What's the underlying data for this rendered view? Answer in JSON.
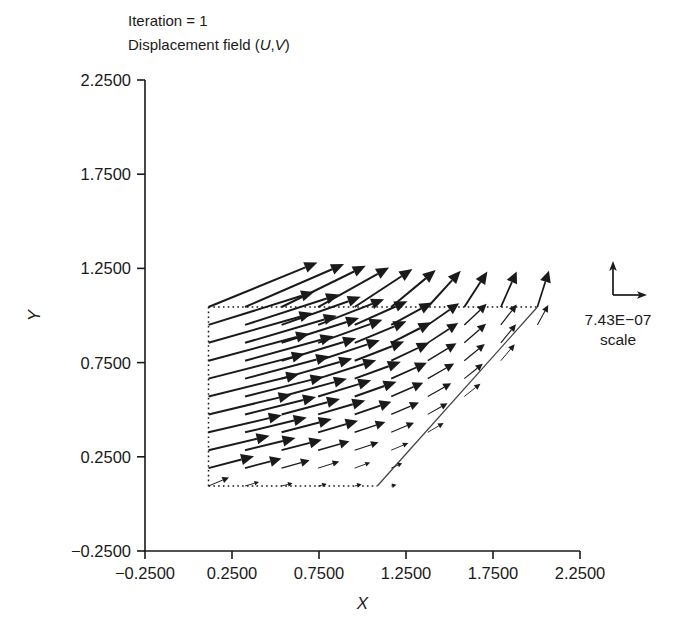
{
  "figure": {
    "annotations": [
      {
        "name": "iteration-label",
        "text": "Iteration = 1"
      },
      {
        "name": "field-label",
        "text": "Displacement field (U,V)"
      }
    ],
    "legend": {
      "magnitude": "7.43E−07",
      "caption": "scale",
      "up_arrow_icon": "arrow-up-icon",
      "right_arrow_icon": "arrow-right-icon"
    }
  },
  "chart_data": {
    "type": "quiver",
    "title": "Iteration = 1",
    "subtitle": "Displacement field (U,V)",
    "xlabel": "X",
    "ylabel": "Y",
    "xlim": [
      -0.25,
      2.25
    ],
    "ylim": [
      -0.25,
      2.25
    ],
    "xticks": [
      -0.25,
      0.25,
      0.75,
      1.25,
      1.75,
      2.25
    ],
    "yticks": [
      -0.25,
      0.25,
      0.75,
      1.25,
      1.75,
      2.25
    ],
    "xticklabels": [
      "−0.2500",
      "0.2500",
      "0.7500",
      "1.2500",
      "1.7500",
      "2.2500"
    ],
    "yticklabels": [
      "−0.2500",
      "0.2500",
      "0.7500",
      "1.2500",
      "1.7500",
      "2.2500"
    ],
    "grid": false,
    "legend_position": "right",
    "scale_reference": 7.43e-07,
    "scale_caption": "scale",
    "domain": {
      "description": "trapezoidal mesh boundary",
      "dotted_edges": [
        [
          [
            0.115,
            0.095
          ],
          [
            0.115,
            1.045
          ]
        ],
        [
          [
            0.115,
            1.045
          ],
          [
            2.005,
            1.045
          ]
        ],
        [
          [
            0.115,
            0.095
          ],
          [
            1.085,
            0.095
          ]
        ]
      ],
      "solid_edges": [
        [
          [
            1.085,
            0.095
          ],
          [
            2.005,
            1.045
          ]
        ]
      ]
    },
    "grid_nx": 10,
    "grid_ny": 11,
    "grid_x": [
      0.115,
      0.325,
      0.535,
      0.745,
      0.955,
      1.165,
      1.375,
      1.585,
      1.795,
      2.005
    ],
    "grid_y": [
      0.095,
      0.19,
      0.285,
      0.38,
      0.475,
      0.57,
      0.665,
      0.76,
      0.855,
      0.95,
      1.045
    ],
    "arrow_scale_px_per_unit": 330,
    "vectors": [
      {
        "x": 0.115,
        "y": 1.045,
        "u": 0.33,
        "v": 0.135
      },
      {
        "x": 0.325,
        "y": 1.045,
        "u": 0.3,
        "v": 0.13
      },
      {
        "x": 0.535,
        "y": 1.045,
        "u": 0.255,
        "v": 0.125
      },
      {
        "x": 0.745,
        "y": 1.045,
        "u": 0.215,
        "v": 0.12
      },
      {
        "x": 0.955,
        "y": 1.045,
        "u": 0.175,
        "v": 0.115
      },
      {
        "x": 1.165,
        "y": 1.045,
        "u": 0.135,
        "v": 0.112
      },
      {
        "x": 1.375,
        "y": 1.045,
        "u": 0.1,
        "v": 0.11
      },
      {
        "x": 1.585,
        "y": 1.045,
        "u": 0.07,
        "v": 0.108
      },
      {
        "x": 1.795,
        "y": 1.045,
        "u": 0.048,
        "v": 0.108
      },
      {
        "x": 2.005,
        "y": 1.045,
        "u": 0.035,
        "v": 0.11
      },
      {
        "x": 0.115,
        "y": 0.95,
        "u": 0.32,
        "v": 0.1
      },
      {
        "x": 0.325,
        "y": 0.95,
        "u": 0.285,
        "v": 0.092
      },
      {
        "x": 0.535,
        "y": 0.95,
        "u": 0.24,
        "v": 0.085
      },
      {
        "x": 0.745,
        "y": 0.95,
        "u": 0.2,
        "v": 0.078
      },
      {
        "x": 0.955,
        "y": 0.95,
        "u": 0.16,
        "v": 0.072
      },
      {
        "x": 1.165,
        "y": 0.95,
        "u": 0.125,
        "v": 0.068
      },
      {
        "x": 1.375,
        "y": 0.95,
        "u": 0.095,
        "v": 0.066
      },
      {
        "x": 1.585,
        "y": 0.95,
        "u": 0.068,
        "v": 0.064
      },
      {
        "x": 1.795,
        "y": 0.95,
        "u": 0.048,
        "v": 0.062
      },
      {
        "x": 2.005,
        "y": 0.95,
        "u": 0.033,
        "v": 0.06
      },
      {
        "x": 0.115,
        "y": 0.855,
        "u": 0.315,
        "v": 0.09
      },
      {
        "x": 0.325,
        "y": 0.855,
        "u": 0.278,
        "v": 0.082
      },
      {
        "x": 0.535,
        "y": 0.855,
        "u": 0.235,
        "v": 0.075
      },
      {
        "x": 0.745,
        "y": 0.855,
        "u": 0.195,
        "v": 0.07
      },
      {
        "x": 0.955,
        "y": 0.855,
        "u": 0.157,
        "v": 0.065
      },
      {
        "x": 1.165,
        "y": 0.855,
        "u": 0.122,
        "v": 0.062
      },
      {
        "x": 1.375,
        "y": 0.855,
        "u": 0.092,
        "v": 0.06
      },
      {
        "x": 1.585,
        "y": 0.855,
        "u": 0.066,
        "v": 0.058
      },
      {
        "x": 1.795,
        "y": 0.855,
        "u": 0.046,
        "v": 0.056
      },
      {
        "x": 0.115,
        "y": 0.76,
        "u": 0.305,
        "v": 0.082
      },
      {
        "x": 0.325,
        "y": 0.76,
        "u": 0.268,
        "v": 0.074
      },
      {
        "x": 0.535,
        "y": 0.76,
        "u": 0.226,
        "v": 0.068
      },
      {
        "x": 0.745,
        "y": 0.76,
        "u": 0.187,
        "v": 0.062
      },
      {
        "x": 0.955,
        "y": 0.76,
        "u": 0.15,
        "v": 0.058
      },
      {
        "x": 1.165,
        "y": 0.76,
        "u": 0.116,
        "v": 0.055
      },
      {
        "x": 1.375,
        "y": 0.76,
        "u": 0.087,
        "v": 0.053
      },
      {
        "x": 1.585,
        "y": 0.76,
        "u": 0.062,
        "v": 0.051
      },
      {
        "x": 1.795,
        "y": 0.76,
        "u": 0.042,
        "v": 0.05
      },
      {
        "x": 0.115,
        "y": 0.665,
        "u": 0.292,
        "v": 0.075
      },
      {
        "x": 0.325,
        "y": 0.665,
        "u": 0.255,
        "v": 0.068
      },
      {
        "x": 0.535,
        "y": 0.665,
        "u": 0.214,
        "v": 0.061
      },
      {
        "x": 0.745,
        "y": 0.665,
        "u": 0.176,
        "v": 0.056
      },
      {
        "x": 0.955,
        "y": 0.665,
        "u": 0.14,
        "v": 0.051
      },
      {
        "x": 1.165,
        "y": 0.665,
        "u": 0.108,
        "v": 0.048
      },
      {
        "x": 1.375,
        "y": 0.665,
        "u": 0.08,
        "v": 0.046
      },
      {
        "x": 1.585,
        "y": 0.665,
        "u": 0.056,
        "v": 0.045
      },
      {
        "x": 0.115,
        "y": 0.57,
        "u": 0.275,
        "v": 0.068
      },
      {
        "x": 0.325,
        "y": 0.57,
        "u": 0.238,
        "v": 0.06
      },
      {
        "x": 0.535,
        "y": 0.57,
        "u": 0.198,
        "v": 0.054
      },
      {
        "x": 0.745,
        "y": 0.57,
        "u": 0.161,
        "v": 0.049
      },
      {
        "x": 0.955,
        "y": 0.57,
        "u": 0.127,
        "v": 0.045
      },
      {
        "x": 1.165,
        "y": 0.57,
        "u": 0.097,
        "v": 0.042
      },
      {
        "x": 1.375,
        "y": 0.57,
        "u": 0.071,
        "v": 0.04
      },
      {
        "x": 1.585,
        "y": 0.57,
        "u": 0.049,
        "v": 0.039
      },
      {
        "x": 0.115,
        "y": 0.475,
        "u": 0.252,
        "v": 0.06
      },
      {
        "x": 0.325,
        "y": 0.475,
        "u": 0.215,
        "v": 0.053
      },
      {
        "x": 0.535,
        "y": 0.475,
        "u": 0.177,
        "v": 0.047
      },
      {
        "x": 0.745,
        "y": 0.475,
        "u": 0.143,
        "v": 0.042
      },
      {
        "x": 0.955,
        "y": 0.475,
        "u": 0.111,
        "v": 0.038
      },
      {
        "x": 1.165,
        "y": 0.475,
        "u": 0.084,
        "v": 0.036
      },
      {
        "x": 1.375,
        "y": 0.475,
        "u": 0.06,
        "v": 0.034
      },
      {
        "x": 0.115,
        "y": 0.38,
        "u": 0.222,
        "v": 0.052
      },
      {
        "x": 0.325,
        "y": 0.38,
        "u": 0.187,
        "v": 0.045
      },
      {
        "x": 0.535,
        "y": 0.38,
        "u": 0.152,
        "v": 0.04
      },
      {
        "x": 0.745,
        "y": 0.38,
        "u": 0.121,
        "v": 0.035
      },
      {
        "x": 0.955,
        "y": 0.38,
        "u": 0.093,
        "v": 0.031
      },
      {
        "x": 1.165,
        "y": 0.38,
        "u": 0.069,
        "v": 0.029
      },
      {
        "x": 1.375,
        "y": 0.38,
        "u": 0.048,
        "v": 0.028
      },
      {
        "x": 0.115,
        "y": 0.285,
        "u": 0.185,
        "v": 0.044
      },
      {
        "x": 0.325,
        "y": 0.285,
        "u": 0.153,
        "v": 0.037
      },
      {
        "x": 0.535,
        "y": 0.285,
        "u": 0.122,
        "v": 0.032
      },
      {
        "x": 0.745,
        "y": 0.285,
        "u": 0.095,
        "v": 0.027
      },
      {
        "x": 0.955,
        "y": 0.285,
        "u": 0.072,
        "v": 0.024
      },
      {
        "x": 1.165,
        "y": 0.285,
        "u": 0.052,
        "v": 0.022
      },
      {
        "x": 0.115,
        "y": 0.19,
        "u": 0.138,
        "v": 0.036
      },
      {
        "x": 0.325,
        "y": 0.19,
        "u": 0.11,
        "v": 0.029
      },
      {
        "x": 0.535,
        "y": 0.19,
        "u": 0.085,
        "v": 0.024
      },
      {
        "x": 0.745,
        "y": 0.19,
        "u": 0.064,
        "v": 0.02
      },
      {
        "x": 0.955,
        "y": 0.19,
        "u": 0.047,
        "v": 0.017
      },
      {
        "x": 1.165,
        "y": 0.19,
        "u": 0.033,
        "v": 0.015
      },
      {
        "x": 0.115,
        "y": 0.095,
        "u": 0.062,
        "v": 0.026
      },
      {
        "x": 0.325,
        "y": 0.095,
        "u": 0.042,
        "v": 0.012
      },
      {
        "x": 0.535,
        "y": 0.095,
        "u": 0.033,
        "v": 0.008
      },
      {
        "x": 0.745,
        "y": 0.095,
        "u": 0.026,
        "v": 0.006
      },
      {
        "x": 0.955,
        "y": 0.095,
        "u": 0.021,
        "v": 0.005
      },
      {
        "x": 1.165,
        "y": 0.095,
        "u": 0.016,
        "v": 0.004
      }
    ]
  }
}
